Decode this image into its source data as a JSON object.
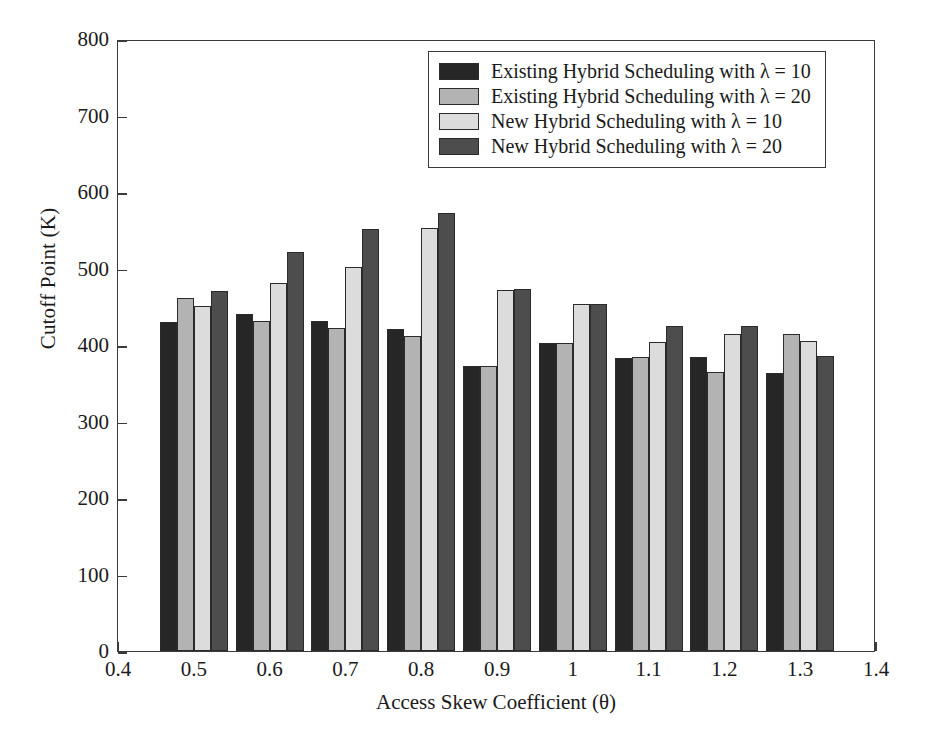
{
  "chart_data": {
    "type": "bar",
    "title": "",
    "xlabel": "Access Skew Coefficient (θ)",
    "ylabel": "Cutoff Point (K)",
    "xlim": [
      0.4,
      1.4
    ],
    "ylim": [
      0,
      800
    ],
    "ytick_labels": [
      "0",
      "100",
      "200",
      "300",
      "400",
      "500",
      "600",
      "700",
      "800"
    ],
    "yticks": [
      0,
      100,
      200,
      300,
      400,
      500,
      600,
      700,
      800
    ],
    "xtick_labels": [
      "0.4",
      "0.5",
      "0.6",
      "0.7",
      "0.8",
      "0.9",
      "1",
      "1.1",
      "1.2",
      "1.3",
      "1.4"
    ],
    "xticks": [
      0.4,
      0.5,
      0.6,
      0.7,
      0.8,
      0.9,
      1.0,
      1.1,
      1.2,
      1.3,
      1.4
    ],
    "categories": [
      0.5,
      0.6,
      0.7,
      0.8,
      0.9,
      1.0,
      1.1,
      1.2,
      1.3
    ],
    "grid": false,
    "legend_position": "upper center",
    "series": [
      {
        "name": "Existing Hybrid Scheduling with λ = 10",
        "color": "#262626",
        "values": [
          430,
          441,
          431,
          421,
          372,
          402,
          383,
          384,
          364
        ]
      },
      {
        "name": "Existing Hybrid Scheduling with λ = 20",
        "color": "#b3b3b3",
        "values": [
          461,
          431,
          422,
          412,
          373,
          403,
          384,
          365,
          415
        ]
      },
      {
        "name": "New Hybrid Scheduling with λ = 10",
        "color": "#dcdcdc",
        "values": [
          451,
          481,
          502,
          553,
          472,
          453,
          404,
          414,
          405
        ]
      },
      {
        "name": "New Hybrid Scheduling with λ = 20",
        "color": "#4d4d4d",
        "values": [
          470,
          521,
          552,
          573,
          473,
          454,
          425,
          425,
          385
        ]
      }
    ]
  }
}
